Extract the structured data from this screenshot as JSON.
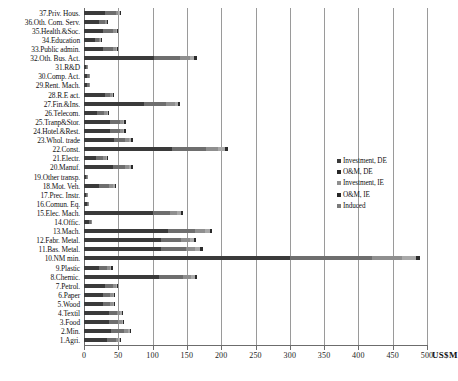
{
  "chart_data": {
    "type": "bar",
    "orientation": "horizontal",
    "stacked": true,
    "title": "",
    "xlabel": "US$M",
    "ylabel": "",
    "xlim": [
      0,
      500
    ],
    "xticks": [
      0,
      50,
      100,
      150,
      200,
      250,
      300,
      350,
      400,
      450,
      500
    ],
    "grid": true,
    "legend_position": "right-middle",
    "legend": [
      "Investment, DE",
      "O&M, DE",
      "Investment, IE",
      "O&M, IE",
      "Induced"
    ],
    "series_colors": [
      "#3a3a3a",
      "#6e6e6e",
      "#8f8f8f",
      "#a9a9a9",
      "#2b2b2b"
    ],
    "categories": [
      "37.Priv. Hous.",
      "36.Oth. Com. Serv.",
      "35.Health.&Soc.",
      "34.Education",
      "33.Public admin.",
      "32.Oth. Bus. Act.",
      "31.R&D",
      "30.Comp. Act.",
      "29.Rent. Mach.",
      "28.R.E act.",
      "27.Fin.&Ins.",
      "26.Telecom.",
      "25.Tranp&Stor.",
      "24.Hotel.&Rest.",
      "23.Whol. trade",
      "22.Const.",
      "21.Electr.",
      "20.Manuf.",
      "19.Other transp.",
      "18.Mot. Veh.",
      "17.Prec. Instr.",
      "16.Comun. Eq.",
      "15.Elec. Mach.",
      "14.Offic.",
      "13.Mach.",
      "12.Fabr. Metal.",
      "11.Bas. Metal.",
      "10.NM min.",
      "9.Plastic",
      "8.Chemic.",
      "7.Petrol.",
      "6.Paper",
      "5.Wood",
      "4.Textil",
      "3.Food",
      "2.Min.",
      "1.Agri."
    ],
    "series": [
      {
        "name": "Investment, DE",
        "values": [
          30,
          22,
          28,
          16,
          28,
          102,
          3,
          5,
          5,
          30,
          88,
          19,
          38,
          38,
          44,
          128,
          18,
          42,
          3,
          22,
          3,
          4,
          100,
          7,
          122,
          112,
          112,
          300,
          22,
          110,
          30,
          28,
          28,
          36,
          36,
          40,
          34
        ]
      },
      {
        "name": "O&M, DE",
        "values": [
          16,
          8,
          14,
          6,
          14,
          38,
          2,
          2,
          2,
          8,
          32,
          10,
          14,
          14,
          16,
          50,
          10,
          18,
          2,
          14,
          2,
          2,
          26,
          3,
          40,
          30,
          36,
          120,
          12,
          34,
          12,
          10,
          10,
          12,
          14,
          18,
          12
        ]
      },
      {
        "name": "Investment, IE",
        "values": [
          4,
          3,
          4,
          2,
          4,
          14,
          1,
          1,
          1,
          3,
          12,
          4,
          5,
          5,
          6,
          18,
          4,
          6,
          1,
          6,
          1,
          1,
          10,
          1,
          14,
          12,
          14,
          44,
          4,
          12,
          4,
          4,
          4,
          5,
          5,
          6,
          4
        ]
      },
      {
        "name": "O&M, IE",
        "values": [
          2,
          1,
          2,
          1,
          2,
          7,
          0,
          0,
          0,
          2,
          5,
          2,
          2,
          2,
          3,
          9,
          2,
          3,
          0,
          3,
          0,
          0,
          5,
          0,
          7,
          6,
          7,
          20,
          2,
          6,
          2,
          2,
          2,
          2,
          2,
          3,
          2
        ]
      },
      {
        "name": "Induced",
        "values": [
          2,
          1,
          2,
          1,
          2,
          4,
          0,
          0,
          0,
          1,
          3,
          1,
          2,
          2,
          2,
          5,
          1,
          2,
          0,
          2,
          0,
          0,
          3,
          0,
          4,
          3,
          4,
          6,
          2,
          3,
          2,
          1,
          1,
          2,
          2,
          2,
          2
        ]
      }
    ]
  }
}
